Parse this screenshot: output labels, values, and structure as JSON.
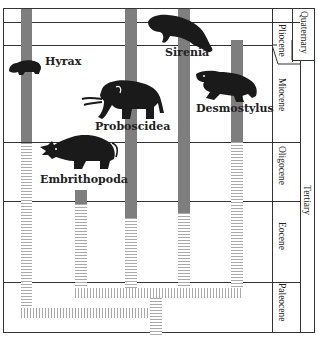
{
  "diagram": {
    "type": "phylogeny-timeline",
    "taxa": [
      {
        "label": "Hyrax"
      },
      {
        "label": "Sirenia"
      },
      {
        "label": "Proboscidea"
      },
      {
        "label": "Desmostylus"
      },
      {
        "label": "Embrithopoda"
      }
    ],
    "epochs": [
      {
        "label": "Pliocene"
      },
      {
        "label": "Miocene"
      },
      {
        "label": "Oligocene"
      },
      {
        "label": "Eocene"
      },
      {
        "label": "Paleocene"
      }
    ],
    "periods": [
      {
        "label": "Quaternary"
      },
      {
        "label": "Tertiary"
      }
    ],
    "colors": {
      "solid_bar": "#7e7e7e",
      "hatch": "#a9a9a9",
      "silhouette": "#1a1a1a",
      "lines": "#333333"
    }
  }
}
